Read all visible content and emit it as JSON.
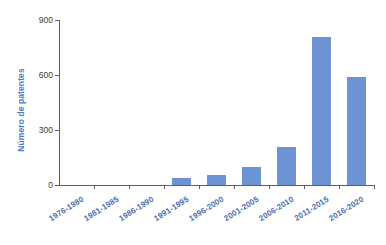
{
  "chart_data": {
    "type": "bar",
    "title": "",
    "xlabel": "",
    "ylabel": "Número de patentes",
    "categories": [
      "1976-1980",
      "1981-1985",
      "1986-1990",
      "1991-1995",
      "1996-2000",
      "2001-2005",
      "2006-2010",
      "2011-2015",
      "2016-2020"
    ],
    "values": [
      0,
      0,
      0,
      38,
      55,
      100,
      207,
      805,
      590
    ],
    "series": [
      {
        "name": "Número de patentes",
        "values": [
          0,
          0,
          0,
          38,
          55,
          100,
          207,
          805,
          590
        ]
      }
    ],
    "ylim": [
      0,
      900
    ],
    "yticks": [
      0,
      300,
      600,
      900
    ],
    "ytick_labels": [
      "0",
      "300",
      "600",
      "900"
    ],
    "grid": false,
    "legend": false,
    "legend_position": "none",
    "bar_color": "#6e93d4",
    "axis_color": "#5f5f5f",
    "label_color": "#4a6fb5",
    "tick_label_color": "#3b3b3b",
    "background_color": "#ffffff"
  }
}
